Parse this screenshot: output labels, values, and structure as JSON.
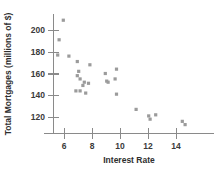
{
  "chart_data": {
    "type": "scatter",
    "title": "",
    "xlabel": "Interest Rate",
    "ylabel": "Total Mortgages (millions of $)",
    "xlim": [
      5.2,
      15.2
    ],
    "ylim": [
      108,
      214
    ],
    "xticks": [
      6,
      8,
      10,
      12,
      14
    ],
    "xtick_labels": [
      "6",
      "8",
      "10",
      "12",
      "14"
    ],
    "yticks": [
      120,
      140,
      160,
      180,
      200
    ],
    "ytick_labels": [
      "120",
      "140",
      "160",
      "180",
      "200"
    ],
    "grid": false,
    "legend": null,
    "marker_color": "#9b9b9b",
    "axis_color": "#8a8a8a",
    "points": [
      {
        "x": 5.95,
        "y": 209
      },
      {
        "x": 5.65,
        "y": 191
      },
      {
        "x": 5.55,
        "y": 177
      },
      {
        "x": 6.35,
        "y": 176
      },
      {
        "x": 6.95,
        "y": 171
      },
      {
        "x": 7.85,
        "y": 168
      },
      {
        "x": 9.75,
        "y": 164
      },
      {
        "x": 7.05,
        "y": 162
      },
      {
        "x": 8.95,
        "y": 160
      },
      {
        "x": 6.95,
        "y": 158
      },
      {
        "x": 7.15,
        "y": 155
      },
      {
        "x": 9.65,
        "y": 155
      },
      {
        "x": 9.05,
        "y": 153
      },
      {
        "x": 7.45,
        "y": 152
      },
      {
        "x": 7.75,
        "y": 151
      },
      {
        "x": 9.15,
        "y": 152
      },
      {
        "x": 7.35,
        "y": 149
      },
      {
        "x": 6.85,
        "y": 144
      },
      {
        "x": 7.15,
        "y": 144
      },
      {
        "x": 7.55,
        "y": 142
      },
      {
        "x": 9.75,
        "y": 141
      },
      {
        "x": 11.15,
        "y": 127
      },
      {
        "x": 12.05,
        "y": 121
      },
      {
        "x": 12.55,
        "y": 122
      },
      {
        "x": 12.15,
        "y": 118
      },
      {
        "x": 14.45,
        "y": 116
      },
      {
        "x": 14.65,
        "y": 113
      }
    ]
  }
}
